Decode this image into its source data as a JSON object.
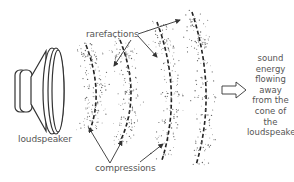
{
  "diagram": {
    "type": "sound-wave-propagation",
    "labels": {
      "rarefactions": "rarefactions",
      "compressions": "compressions",
      "loudspeaker": "loudspeaker"
    },
    "flow_text": [
      "sound",
      "energy",
      "flowing",
      "away",
      "from the",
      "cone of the",
      "loudspeaker"
    ],
    "colors": {
      "stroke": "#333333",
      "text": "#555555",
      "dots": "#666666",
      "background": "#ffffff"
    },
    "wavefronts": 4
  }
}
